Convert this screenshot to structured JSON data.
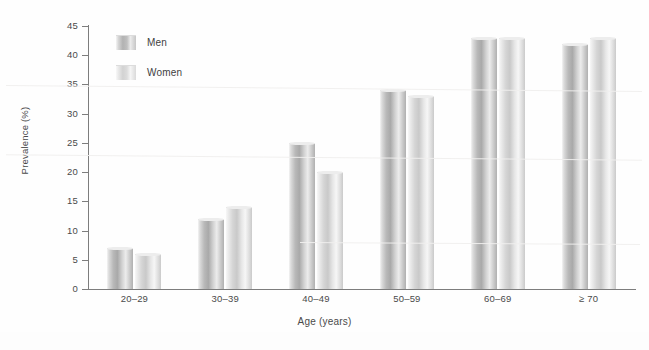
{
  "chart_data": {
    "type": "bar",
    "title": "",
    "xlabel": "Age (years)",
    "ylabel": "Prevalence (%)",
    "categories": [
      "20–29",
      "30–39",
      "40–49",
      "50–59",
      "60–69",
      "≥ 70"
    ],
    "series": [
      {
        "name": "Men",
        "values": [
          7,
          12,
          25,
          34,
          43,
          42
        ],
        "color": "#b2b2b2"
      },
      {
        "name": "Women",
        "values": [
          6,
          14,
          20,
          33,
          43,
          43
        ],
        "color": "#d6d6d6"
      }
    ],
    "ylim": [
      0,
      45
    ],
    "ytick_step": 5,
    "yticks": [
      "45",
      "40",
      "35",
      "30",
      "25",
      "20",
      "15",
      "10",
      "5",
      "0"
    ],
    "grid": false,
    "legend_position": "top-left-inside"
  },
  "axes": {
    "y_title": "Prevalence (%)",
    "x_title": "Age (years)"
  },
  "legend": {
    "items": [
      {
        "label": "Men"
      },
      {
        "label": "Women"
      }
    ]
  }
}
